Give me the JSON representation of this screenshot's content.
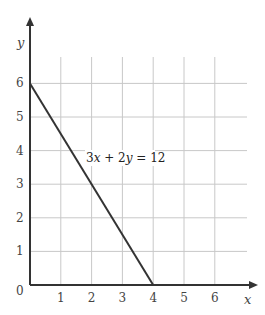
{
  "chart_data": {
    "type": "line",
    "title": "",
    "xlabel": "x",
    "ylabel": "y",
    "xlim": [
      0,
      7
    ],
    "ylim": [
      0,
      7
    ],
    "grid": true,
    "x_ticks": [
      "1",
      "2",
      "3",
      "4",
      "5",
      "6"
    ],
    "y_ticks": [
      "1",
      "2",
      "3",
      "4",
      "5",
      "6"
    ],
    "origin_label": "0",
    "series": [
      {
        "name": "3x + 2y = 12",
        "x": [
          0,
          4
        ],
        "y": [
          6,
          0
        ]
      }
    ],
    "annotations": [
      {
        "text": "3x + 2y = 12",
        "x": 1.8,
        "y": 3.5
      }
    ]
  },
  "labels": {
    "x_axis": "x",
    "y_axis": "y",
    "origin": "0",
    "eq_a": "3",
    "eq_x": "x",
    "eq_plus": " + 2",
    "eq_y": "y",
    "eq_rest": " = 12"
  },
  "colors": {
    "axis": "#333333",
    "grid": "#c8c8c8",
    "line": "#333333"
  }
}
